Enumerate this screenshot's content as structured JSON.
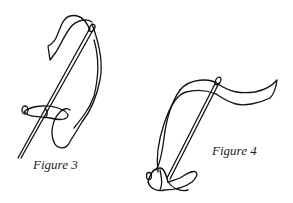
{
  "figures": [
    {
      "id": "figure-3",
      "caption": "Figure 3"
    },
    {
      "id": "figure-4",
      "caption": "Figure 4"
    }
  ],
  "colors": {
    "line": "#111111",
    "background": "#ffffff"
  }
}
